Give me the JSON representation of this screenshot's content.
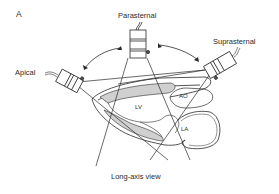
{
  "figure": {
    "panel_label": "A",
    "caption": "Long-axis view"
  },
  "probes": {
    "parasternal": "Parasternal",
    "apical": "Apical",
    "suprasternal": "Suprasternal"
  },
  "structures": {
    "lv": "LV",
    "ao": "AO",
    "la": "LA"
  },
  "colors": {
    "line": "#2a2a2a",
    "hatch": "#bdbdbd",
    "background": "#ffffff"
  }
}
